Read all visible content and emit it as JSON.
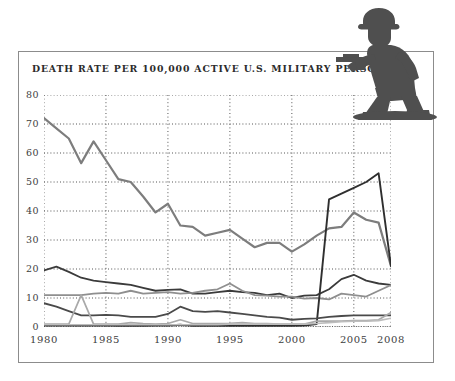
{
  "figure": {
    "title": "DEATH RATE PER 100,000 ACTIVE U.S. MILITARY PERSONNEL",
    "decoration_icon": "toy-soldier-icon",
    "frame_color": "#8c8c8c",
    "background": "#ffffff"
  },
  "chart_data": {
    "type": "line",
    "title": "DEATH RATE PER 100,000 ACTIVE U.S. MILITARY PERSONNEL",
    "xlabel": "",
    "ylabel": "",
    "xlim": [
      1980,
      2008
    ],
    "ylim": [
      0,
      80
    ],
    "ytick_step": 10,
    "grid": "horizontal-dotted",
    "legend": "none",
    "xtick_labels": [
      "1980",
      "1985",
      "1990",
      "1995",
      "2000",
      "2005",
      "2008"
    ],
    "xticks": [
      1980,
      1985,
      1990,
      1995,
      2000,
      2005,
      2008
    ],
    "ytick_labels": [
      "0",
      "10",
      "20",
      "30",
      "40",
      "50",
      "60",
      "70",
      "80"
    ],
    "yticks": [
      0,
      10,
      20,
      30,
      40,
      50,
      60,
      70,
      80
    ],
    "x": [
      1980,
      1981,
      1982,
      1983,
      1984,
      1985,
      1986,
      1987,
      1988,
      1989,
      1990,
      1991,
      1992,
      1993,
      1994,
      1995,
      1996,
      1997,
      1998,
      1999,
      2000,
      2001,
      2002,
      2003,
      2004,
      2005,
      2006,
      2007,
      2008
    ],
    "series": [
      {
        "name": "total-death-rate",
        "color": "#7d7d7d",
        "width": 2.2,
        "values": [
          72.0,
          68.5,
          65.0,
          56.5,
          64.0,
          57.5,
          51.0,
          50.0,
          45.0,
          39.5,
          42.5,
          35.0,
          34.5,
          31.5,
          32.5,
          33.5,
          30.5,
          27.5,
          29.0,
          29.0,
          26.0,
          28.5,
          31.5,
          34.0,
          34.5,
          39.5,
          37.0,
          36.0,
          21.0
        ]
      },
      {
        "name": "accident-death-rate",
        "color": "#3b3b3b",
        "width": 1.8,
        "values": [
          19.5,
          20.8,
          19.0,
          17.0,
          16.0,
          15.5,
          15.0,
          14.5,
          13.5,
          12.5,
          12.8,
          13.0,
          11.5,
          11.5,
          12.0,
          12.5,
          12.0,
          11.8,
          11.0,
          11.5,
          10.0,
          10.8,
          11.0,
          13.0,
          16.5,
          18.0,
          16.0,
          15.0,
          14.5
        ]
      },
      {
        "name": "illness-death-rate",
        "color": "#8f8f8f",
        "width": 1.8,
        "values": [
          11.0,
          11.0,
          11.0,
          11.0,
          11.5,
          11.8,
          11.5,
          12.5,
          11.5,
          11.8,
          12.0,
          11.5,
          11.8,
          12.5,
          13.0,
          15.0,
          12.5,
          11.0,
          10.8,
          10.5,
          10.5,
          9.8,
          10.0,
          9.5,
          11.5,
          11.0,
          10.5,
          12.5,
          14.5
        ]
      },
      {
        "name": "hostile-action-death-rate",
        "color": "#2f2f2f",
        "width": 1.9,
        "values": [
          0.5,
          0.5,
          0.5,
          0.5,
          0.5,
          0.5,
          0.4,
          0.5,
          0.4,
          0.5,
          0.5,
          0.8,
          0.4,
          0.4,
          0.4,
          0.4,
          0.4,
          0.4,
          0.4,
          0.4,
          0.4,
          0.5,
          1.0,
          44.0,
          46.0,
          48.0,
          50.0,
          53.0,
          21.0
        ]
      },
      {
        "name": "self-inflicted-death-rate",
        "color": "#4a4a4a",
        "width": 1.8,
        "values": [
          8.2,
          7.0,
          5.5,
          4.0,
          4.0,
          4.2,
          4.0,
          3.5,
          3.5,
          3.5,
          4.5,
          7.0,
          5.5,
          5.2,
          5.5,
          5.0,
          4.5,
          4.0,
          3.5,
          3.2,
          2.5,
          2.8,
          3.0,
          3.5,
          3.8,
          4.0,
          4.0,
          4.0,
          4.0
        ]
      },
      {
        "name": "homicide-death-rate",
        "color": "#a9a9a9",
        "width": 1.7,
        "values": [
          1.0,
          1.0,
          1.0,
          11.0,
          1.0,
          1.0,
          1.0,
          1.5,
          1.2,
          1.0,
          1.2,
          2.5,
          1.2,
          1.2,
          1.2,
          1.3,
          1.5,
          1.2,
          1.2,
          1.0,
          1.0,
          1.0,
          2.0,
          2.0,
          2.0,
          2.2,
          2.2,
          2.5,
          5.0
        ]
      },
      {
        "name": "other-death-rate",
        "color": "#bdbdbd",
        "width": 1.6,
        "values": [
          0.8,
          0.8,
          0.8,
          0.8,
          0.8,
          0.8,
          0.8,
          0.8,
          0.8,
          0.8,
          0.8,
          0.8,
          0.8,
          0.8,
          0.8,
          1.0,
          1.0,
          1.0,
          1.0,
          1.0,
          1.0,
          1.0,
          1.2,
          1.5,
          1.8,
          2.0,
          2.0,
          2.2,
          3.0
        ]
      }
    ]
  }
}
